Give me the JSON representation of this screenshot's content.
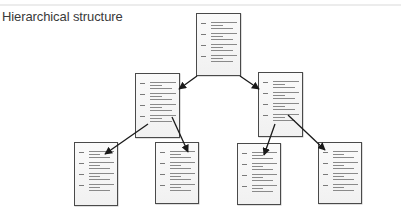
{
  "title": "Hierarchical structure",
  "colors": {
    "border": "#4a4a4a",
    "arrow": "#1a1a1a",
    "text_lines": "#8a8a8a",
    "title": "#3a3a3a"
  },
  "nodes": [
    {
      "id": "root",
      "level": 0,
      "label": "root-document",
      "x": 196,
      "y": 13,
      "w": 45,
      "h": 63,
      "entries": 4
    },
    {
      "id": "mid-left",
      "level": 1,
      "label": "child-document-left",
      "x": 135,
      "y": 73,
      "w": 45,
      "h": 65,
      "entries": 4
    },
    {
      "id": "mid-right",
      "level": 1,
      "label": "child-document-right",
      "x": 258,
      "y": 72,
      "w": 45,
      "h": 65,
      "entries": 4
    },
    {
      "id": "leaf-1",
      "level": 2,
      "label": "leaf-document-1",
      "x": 74,
      "y": 142,
      "w": 44,
      "h": 64,
      "entries": 4
    },
    {
      "id": "leaf-2",
      "level": 2,
      "label": "leaf-document-2",
      "x": 155,
      "y": 142,
      "w": 44,
      "h": 62,
      "entries": 4
    },
    {
      "id": "leaf-3",
      "level": 2,
      "label": "leaf-document-3",
      "x": 237,
      "y": 143,
      "w": 44,
      "h": 62,
      "entries": 4
    },
    {
      "id": "leaf-4",
      "level": 2,
      "label": "leaf-document-4",
      "x": 318,
      "y": 142,
      "w": 44,
      "h": 62,
      "entries": 4
    }
  ],
  "edges": [
    {
      "from": "root",
      "to": "mid-left",
      "x1": 197,
      "y1": 76,
      "x2": 179,
      "y2": 89
    },
    {
      "from": "root",
      "to": "mid-right",
      "x1": 240,
      "y1": 76,
      "x2": 259,
      "y2": 89
    },
    {
      "from": "mid-left",
      "to": "leaf-1",
      "x1": 148,
      "y1": 124,
      "x2": 105,
      "y2": 154
    },
    {
      "from": "mid-left",
      "to": "leaf-2",
      "x1": 172,
      "y1": 117,
      "x2": 188,
      "y2": 152
    },
    {
      "from": "mid-right",
      "to": "leaf-3",
      "x1": 275,
      "y1": 124,
      "x2": 264,
      "y2": 155
    },
    {
      "from": "mid-right",
      "to": "leaf-4",
      "x1": 288,
      "y1": 115,
      "x2": 325,
      "y2": 150
    }
  ]
}
